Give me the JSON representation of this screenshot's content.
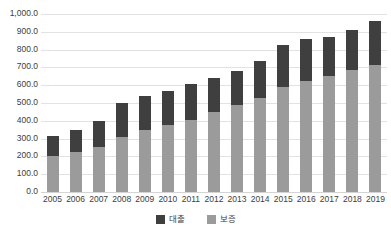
{
  "top_caption": "",
  "chart_data": {
    "type": "bar",
    "subtype": "stacked-column",
    "title": "",
    "subtitle": "",
    "xlabel": "",
    "ylabel": "",
    "ylim": [
      0,
      1000
    ],
    "grid": true,
    "legend_position": "bottom",
    "categories": [
      "2005",
      "2006",
      "2007",
      "2008",
      "2009",
      "2010",
      "2011",
      "2012",
      "2013",
      "2014",
      "2015",
      "2016",
      "2017",
      "2018",
      "2019"
    ],
    "ytick_labels": [
      "1,000.0",
      "900.0",
      "800.0",
      "700.0",
      "600.0",
      "500.0",
      "400.0",
      "300.0",
      "200.0",
      "100.0",
      "0.0"
    ],
    "ytick_values": [
      1000,
      900,
      800,
      700,
      600,
      500,
      400,
      300,
      200,
      100,
      0
    ],
    "series": [
      {
        "name": "보증",
        "color": "#9b9b9b",
        "stack_order": 0,
        "values": [
          205.0,
          222.0,
          255.0,
          310.0,
          348.0,
          375.0,
          402.0,
          450.0,
          488.0,
          528.0,
          590.0,
          625.0,
          650.0,
          685.0,
          715.0
        ]
      },
      {
        "name": "대출",
        "color": "#3f3f3f",
        "stack_order": 1,
        "values": [
          110.0,
          128.0,
          145.0,
          190.0,
          192.0,
          193.0,
          203.0,
          193.0,
          192.0,
          210.0,
          235.0,
          235.0,
          222.0,
          227.0,
          243.0
        ]
      }
    ],
    "totals": [
      315.0,
      350.0,
      400.0,
      500.0,
      540.0,
      568.0,
      605.0,
      643.0,
      680.0,
      738.0,
      825.0,
      860.0,
      872.0,
      912.0,
      958.0
    ]
  },
  "legend": {
    "items": [
      {
        "label": "대출",
        "color": "#3f3f3f"
      },
      {
        "label": "보증",
        "color": "#9b9b9b"
      }
    ]
  },
  "colors": {
    "daechul": "#3f3f3f",
    "bojeung": "#9b9b9b",
    "grid": "#e2e2e2",
    "text": "#3d3d3d",
    "background": "#ffffff"
  }
}
